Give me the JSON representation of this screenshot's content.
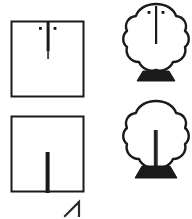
{
  "figure": {
    "title": "Tree trunk position diagram",
    "background_color": "#ffffff",
    "stroke_color": "#1a1a1a",
    "fill_color": "#000000",
    "width": 192,
    "height": 219,
    "panels": [
      {
        "id": "plan-top",
        "label": "plan-view-top",
        "shape": "square",
        "x": 11,
        "y": 21,
        "width": 73,
        "height": 76,
        "trunk": {
          "orientation": "from-top-edge",
          "x": 48,
          "y_start": 21,
          "y_end": 58,
          "thickness": 3
        },
        "dots": [
          {
            "x": 40,
            "y": 28,
            "size": 3
          },
          {
            "x": 55,
            "y": 28,
            "size": 3
          }
        ]
      },
      {
        "id": "plan-bottom",
        "label": "plan-view-bottom",
        "shape": "square",
        "x": 11,
        "y": 116,
        "width": 73,
        "height": 76,
        "trunk": {
          "orientation": "from-bottom-edge",
          "x": 48,
          "y_start": 192,
          "y_end": 152,
          "thickness": 4
        },
        "dots": []
      },
      {
        "id": "elevation-top",
        "label": "elevation-view-top",
        "shape": "tree",
        "canopy_cx": 156,
        "canopy_cy": 38,
        "canopy_rx": 30,
        "canopy_ry": 36,
        "trunk": {
          "orientation": "from-top",
          "x": 156,
          "y_start": 6,
          "y_end": 44,
          "thickness": 2
        },
        "dots": [
          {
            "x": 149,
            "y": 12,
            "size": 3
          },
          {
            "x": 163,
            "y": 12,
            "size": 3
          }
        ],
        "base": {
          "cx": 156,
          "top_y": 72,
          "bottom_y": 82,
          "top_half_width": 13,
          "bottom_half_width": 19
        }
      },
      {
        "id": "elevation-bottom",
        "label": "elevation-view-bottom",
        "shape": "tree",
        "canopy_cx": 156,
        "canopy_cy": 135,
        "canopy_rx": 30,
        "canopy_ry": 36,
        "trunk": {
          "orientation": "from-base",
          "x": 156,
          "y_start": 168,
          "y_end": 132,
          "thickness": 4
        },
        "dots": [],
        "base": {
          "cx": 156,
          "top_y": 166,
          "bottom_y": 177,
          "top_half_width": 14,
          "bottom_half_width": 21
        }
      }
    ],
    "footer_mark": {
      "id": "caret-mark",
      "label": "caret-arrow-mark",
      "x": 65,
      "y": 203,
      "width": 16,
      "height": 14
    }
  }
}
